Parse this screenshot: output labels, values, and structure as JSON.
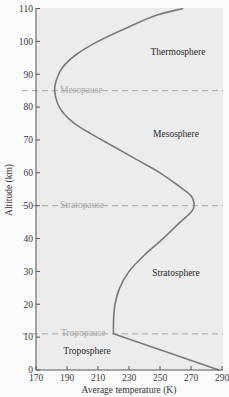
{
  "chart_data": {
    "type": "line",
    "title": "",
    "xlabel": "Average temperature (K)",
    "ylabel": "Altitude (km)",
    "xlim": [
      170,
      290
    ],
    "ylim": [
      0,
      110
    ],
    "xticks": [
      170,
      190,
      210,
      230,
      250,
      270,
      290
    ],
    "yticks": [
      0,
      10,
      20,
      30,
      40,
      50,
      60,
      70,
      80,
      90,
      100,
      110
    ],
    "grid": false,
    "series": [
      {
        "name": "Average temperature profile",
        "color": "#7a7a7a",
        "points": [
          {
            "T": 288,
            "alt": 0
          },
          {
            "T": 220,
            "alt": 11
          },
          {
            "T": 220,
            "alt": 15
          },
          {
            "T": 221,
            "alt": 20
          },
          {
            "T": 224,
            "alt": 25
          },
          {
            "T": 230,
            "alt": 30
          },
          {
            "T": 240,
            "alt": 35
          },
          {
            "T": 252,
            "alt": 40
          },
          {
            "T": 263,
            "alt": 45
          },
          {
            "T": 270,
            "alt": 48
          },
          {
            "T": 272,
            "alt": 50
          },
          {
            "T": 270,
            "alt": 53
          },
          {
            "T": 262,
            "alt": 56
          },
          {
            "T": 250,
            "alt": 60
          },
          {
            "T": 235,
            "alt": 64
          },
          {
            "T": 220,
            "alt": 68
          },
          {
            "T": 205,
            "alt": 72
          },
          {
            "T": 195,
            "alt": 75
          },
          {
            "T": 188,
            "alt": 78
          },
          {
            "T": 184,
            "alt": 81
          },
          {
            "T": 182,
            "alt": 85
          },
          {
            "T": 183,
            "alt": 88
          },
          {
            "T": 187,
            "alt": 92
          },
          {
            "T": 196,
            "alt": 96
          },
          {
            "T": 210,
            "alt": 100
          },
          {
            "T": 228,
            "alt": 104
          },
          {
            "T": 248,
            "alt": 108
          },
          {
            "T": 265,
            "alt": 110
          }
        ]
      }
    ],
    "boundaries": [
      {
        "name": "Tropopause",
        "alt": 11
      },
      {
        "name": "Stratopause",
        "alt": 50
      },
      {
        "name": "Mesopause",
        "alt": 85
      }
    ],
    "regions": [
      {
        "name": "Troposphere",
        "label_T": 206,
        "label_alt": 5
      },
      {
        "name": "Stratosphere",
        "label_T": 266,
        "label_alt": 27
      },
      {
        "name": "Mesosphere",
        "label_T": 266,
        "label_alt": 70
      },
      {
        "name": "Thermosphere",
        "label_T": 266,
        "label_alt": 96
      }
    ]
  },
  "labels": {
    "xlabel": "Average temperature (K)",
    "ylabel": "Altitude (km)",
    "tropopause": "Tropopause",
    "stratopause": "Stratopause",
    "mesopause": "Mesopause",
    "troposphere": "Troposphere",
    "stratosphere": "Stratosphere",
    "mesosphere": "Mesosphere",
    "thermosphere": "Thermosphere"
  }
}
